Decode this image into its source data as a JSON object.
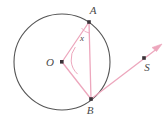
{
  "figure": {
    "kind": "circle-geometry-diagram",
    "width": 168,
    "height": 117,
    "background_color": "#ffffff",
    "colors": {
      "circle_stroke": "#555555",
      "segment_stroke": "#eda7bd",
      "arc_stroke": "#eda7bd",
      "point_fill": "#3a3338",
      "label_fill": "#4a4a4a"
    },
    "circle": {
      "center_x": 62,
      "center_y": 62,
      "radius": 48,
      "stroke_width": 1.1
    },
    "points": [
      {
        "name": "O",
        "label": "O",
        "x": 62,
        "y": 62,
        "label_x": 50,
        "label_y": 66,
        "on_circle": false,
        "role": "center"
      },
      {
        "name": "A",
        "label": "A",
        "x": 89,
        "y": 22,
        "label_x": 93,
        "label_y": 14,
        "on_circle": true,
        "role": "circle-point"
      },
      {
        "name": "B",
        "label": "B",
        "x": 91,
        "y": 99,
        "label_x": 88,
        "label_y": 113,
        "on_circle": true,
        "role": "circle-point"
      },
      {
        "name": "S",
        "label": "S",
        "x": 144,
        "y": 58,
        "label_x": 146,
        "label_y": 71,
        "on_circle": false,
        "role": "external-point"
      }
    ],
    "segments": [
      {
        "name": "radius-OA",
        "from": "O",
        "to": "A",
        "x1": 62,
        "y1": 62,
        "x2": 89,
        "y2": 22
      },
      {
        "name": "radius-OB",
        "from": "O",
        "to": "B",
        "x1": 62,
        "y1": 62,
        "x2": 91,
        "y2": 99
      },
      {
        "name": "chord-AB",
        "from": "A",
        "to": "B",
        "x1": 89,
        "y1": 22,
        "x2": 91,
        "y2": 99
      }
    ],
    "rays": [
      {
        "name": "ray-BS",
        "from": "B",
        "through": "S",
        "x1": 91,
        "y1": 99,
        "x2": 161,
        "y2": 46,
        "arrow_at_end": true
      }
    ],
    "angle_marks": [
      {
        "name": "angle-at-O",
        "vertex": "O",
        "between": [
          "OA",
          "OB"
        ],
        "label": "",
        "radius": 20
      },
      {
        "name": "angle-x-at-A",
        "vertex": "A",
        "between": [
          "AO",
          "AB"
        ],
        "label": "x",
        "label_x": 80,
        "label_y": 40,
        "radius": 11
      }
    ]
  }
}
